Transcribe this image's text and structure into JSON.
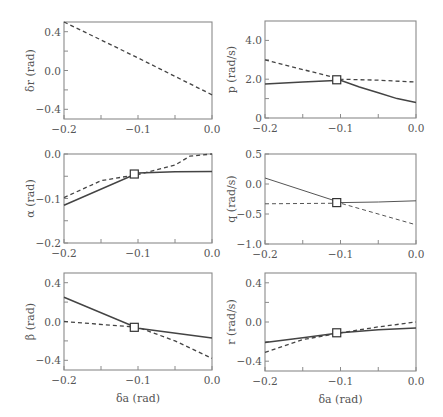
{
  "chart_data": [
    {
      "id": "dr",
      "type": "line",
      "ylabel": "δr (rad)",
      "xlabel": "",
      "xlim": [
        -0.2,
        0.0
      ],
      "ylim": [
        -0.5,
        0.5
      ],
      "xticks": [
        -0.2,
        -0.15,
        -0.1,
        -0.05,
        0.0
      ],
      "xticklabels": [
        "−0.2",
        "",
        "−0.1",
        "",
        "0.0"
      ],
      "yticks": [
        -0.4,
        -0.2,
        0.0,
        0.2,
        0.4
      ],
      "yticklabels": [
        "−0.4",
        "",
        "0.0",
        "",
        "0.4"
      ],
      "box": [
        64,
        22,
        212,
        119
      ],
      "series": [
        {
          "name": "dashed",
          "style": "dashed",
          "x": [
            -0.2,
            -0.1,
            0.0
          ],
          "y": [
            0.5,
            0.13,
            -0.25
          ]
        }
      ],
      "marker": null
    },
    {
      "id": "p",
      "type": "line",
      "ylabel": "p (rad/s)",
      "xlabel": "",
      "xlim": [
        -0.2,
        0.0
      ],
      "ylim": [
        0.0,
        5.0
      ],
      "xticks": [
        -0.2,
        -0.15,
        -0.1,
        -0.05,
        0.0
      ],
      "xticklabels": [
        "−0.2",
        "",
        "−0.1",
        "",
        "0.0"
      ],
      "yticks": [
        0.0,
        1.0,
        2.0,
        3.0,
        4.0
      ],
      "yticklabels": [
        "0",
        "",
        "2.0",
        "",
        "4.0"
      ],
      "box": [
        265,
        21,
        416,
        118
      ],
      "series": [
        {
          "name": "solid",
          "style": "solid",
          "x": [
            -0.2,
            -0.15,
            -0.1,
            -0.075,
            -0.05,
            -0.025,
            0.0
          ],
          "y": [
            1.75,
            1.85,
            1.95,
            1.6,
            1.3,
            1.0,
            0.8
          ]
        },
        {
          "name": "dashed",
          "style": "dashed",
          "x": [
            -0.2,
            -0.1,
            -0.05,
            0.0
          ],
          "y": [
            3.0,
            2.0,
            1.95,
            1.85
          ]
        }
      ],
      "marker": {
        "x": -0.105,
        "y": 1.97
      }
    },
    {
      "id": "alpha",
      "type": "line",
      "ylabel": "α (rad)",
      "xlabel": "",
      "xlim": [
        -0.2,
        0.0
      ],
      "ylim": [
        -0.2,
        0.0
      ],
      "xticks": [
        -0.2,
        -0.15,
        -0.1,
        -0.05,
        0.0
      ],
      "xticklabels": [
        "−0.2",
        "",
        "−0.1",
        "",
        "0.0"
      ],
      "yticks": [
        -0.2,
        -0.15,
        -0.1,
        -0.05,
        0.0
      ],
      "yticklabels": [
        "−0.2",
        "",
        "−0.1",
        "",
        "0.0"
      ],
      "box": [
        64,
        154,
        212,
        243
      ],
      "series": [
        {
          "name": "solid",
          "style": "solid",
          "x": [
            -0.2,
            -0.1,
            -0.05,
            0.0
          ],
          "y": [
            -0.115,
            -0.043,
            -0.04,
            -0.039
          ]
        },
        {
          "name": "dashed",
          "style": "dashed",
          "x": [
            -0.2,
            -0.15,
            -0.1,
            -0.05,
            -0.03,
            0.0
          ],
          "y": [
            -0.098,
            -0.06,
            -0.046,
            -0.025,
            -0.005,
            0.0
          ]
        }
      ],
      "marker": {
        "x": -0.105,
        "y": -0.045
      }
    },
    {
      "id": "q",
      "type": "line",
      "ylabel": "q (rad/s)",
      "xlabel": "",
      "xlim": [
        -0.2,
        0.0
      ],
      "ylim": [
        -1.0,
        0.5
      ],
      "xticks": [
        -0.2,
        -0.15,
        -0.1,
        -0.05,
        0.0
      ],
      "xticklabels": [
        "−0.2",
        "",
        "−0.1",
        "",
        "0.0"
      ],
      "yticks": [
        -1.0,
        -0.5,
        0.0,
        0.5
      ],
      "yticklabels": [
        "−1.0",
        "−0.5",
        "0.0",
        "0.5"
      ],
      "box": [
        265,
        154,
        416,
        244
      ],
      "series": [
        {
          "name": "solid",
          "style": "thin-solid",
          "x": [
            -0.2,
            -0.1,
            -0.05,
            0.0
          ],
          "y": [
            0.1,
            -0.31,
            -0.3,
            -0.28
          ]
        },
        {
          "name": "dashed",
          "style": "thin-dashed",
          "x": [
            -0.2,
            -0.1,
            0.0
          ],
          "y": [
            -0.33,
            -0.32,
            -0.68
          ]
        }
      ],
      "marker": {
        "x": -0.105,
        "y": -0.31
      }
    },
    {
      "id": "beta",
      "type": "line",
      "ylabel": "β (rad)",
      "xlabel": "δa (rad)",
      "xlim": [
        -0.2,
        0.0
      ],
      "ylim": [
        -0.5,
        0.5
      ],
      "xticks": [
        -0.2,
        -0.15,
        -0.1,
        -0.05,
        0.0
      ],
      "xticklabels": [
        "−0.2",
        "",
        "−0.1",
        "",
        "0.0"
      ],
      "yticks": [
        -0.4,
        -0.2,
        0.0,
        0.2,
        0.4
      ],
      "yticklabels": [
        "−0.4",
        "",
        "0.0",
        "",
        "0.4"
      ],
      "box": [
        64,
        273,
        212,
        370
      ],
      "series": [
        {
          "name": "solid",
          "style": "solid",
          "x": [
            -0.2,
            -0.1,
            0.0
          ],
          "y": [
            0.25,
            -0.07,
            -0.17
          ]
        },
        {
          "name": "dashed",
          "style": "dashed",
          "x": [
            -0.2,
            -0.1,
            -0.05,
            0.0
          ],
          "y": [
            0.0,
            -0.06,
            -0.2,
            -0.38
          ]
        }
      ],
      "marker": {
        "x": -0.105,
        "y": -0.06
      }
    },
    {
      "id": "r",
      "type": "line",
      "ylabel": "r (rad/s)",
      "xlabel": "δa (rad)",
      "xlim": [
        -0.2,
        0.0
      ],
      "ylim": [
        -0.5,
        0.5
      ],
      "xticks": [
        -0.2,
        -0.15,
        -0.1,
        -0.05,
        0.0
      ],
      "xticklabels": [
        "−0.2",
        "",
        "−0.1",
        "",
        "0.0"
      ],
      "yticks": [
        -0.4,
        -0.2,
        0.0,
        0.2,
        0.4
      ],
      "yticklabels": [
        "−0.4",
        "",
        "0.0",
        "",
        "0.4"
      ],
      "box": [
        265,
        273,
        416,
        371
      ],
      "series": [
        {
          "name": "solid",
          "style": "solid",
          "x": [
            -0.2,
            -0.15,
            -0.1,
            -0.05,
            0.0
          ],
          "y": [
            -0.21,
            -0.16,
            -0.11,
            -0.08,
            -0.06
          ]
        },
        {
          "name": "dashed",
          "style": "dashed",
          "x": [
            -0.2,
            -0.15,
            -0.1,
            -0.05,
            0.0
          ],
          "y": [
            -0.31,
            -0.18,
            -0.11,
            -0.05,
            0.0
          ]
        }
      ],
      "marker": {
        "x": -0.105,
        "y": -0.11
      }
    }
  ]
}
